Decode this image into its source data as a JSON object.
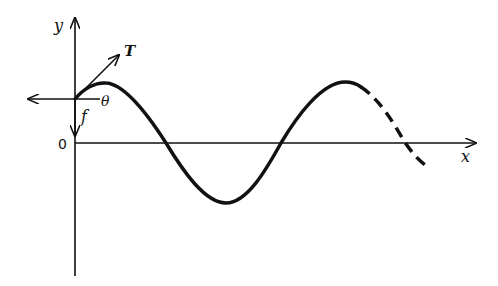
{
  "diagram": {
    "labels": {
      "y_axis": "y",
      "x_axis": "x",
      "origin": "0",
      "tension": "T",
      "angle": "θ",
      "force": "f"
    },
    "colors": {
      "stroke": "#111111",
      "background": "#ffffff"
    },
    "elements": [
      {
        "name": "y-axis",
        "type": "arrow",
        "direction": "up"
      },
      {
        "name": "x-axis",
        "type": "arrow",
        "direction": "right"
      },
      {
        "name": "tension-vector",
        "type": "arrow",
        "label": "T"
      },
      {
        "name": "horizontal-force-vector",
        "type": "arrow",
        "direction": "left"
      },
      {
        "name": "vertical-force-vector",
        "type": "arrow",
        "direction": "down",
        "label": "f"
      },
      {
        "name": "wave-solid",
        "type": "curve",
        "style": "solid"
      },
      {
        "name": "wave-dashed",
        "type": "curve",
        "style": "dashed"
      }
    ]
  }
}
